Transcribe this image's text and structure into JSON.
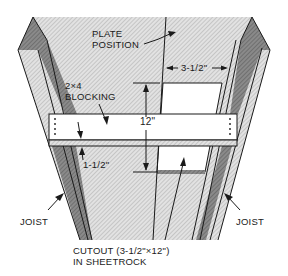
{
  "diagram": {
    "labels": {
      "plate_position_line1": "PLATE",
      "plate_position_line2": "POSITION",
      "blocking_line1": "2×4",
      "blocking_line2": "BLOCKING",
      "dim_width": "3-1/2\"",
      "dim_height": "12\"",
      "dim_thickness": "1-1/2\"",
      "joist_left": "JOIST",
      "joist_right": "JOIST",
      "cutout_line1": "CUTOUT (3-1/2\"×12\")",
      "cutout_line2": "IN SHEETROCK"
    },
    "colors": {
      "background": "#ffffff",
      "ceiling_hatch_light": "#d9d9d9",
      "ceiling_hatch_dark": "#bdbdbd",
      "joist_dark": "#7a7a7a",
      "line": "#1a1a1a",
      "board": "#ffffff"
    }
  }
}
